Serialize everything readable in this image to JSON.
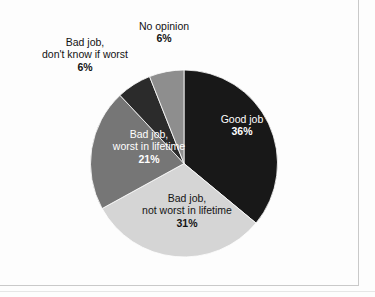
{
  "chart_data": {
    "type": "pie",
    "title": "",
    "subtitle": "",
    "xlabel": "",
    "ylabel": "",
    "legend_position": "none",
    "grid": false,
    "start_angle_deg": 0,
    "direction": "clockwise",
    "categories": [
      "Good job",
      "Bad job, not worst in lifetime",
      "Bad job, worst in lifetime",
      "Bad job, don't know if worst",
      "No opinion"
    ],
    "values": [
      36,
      31,
      21,
      6,
      6
    ],
    "value_suffix": "%",
    "slices": [
      {
        "name": "good-job",
        "label_line1": "Good job",
        "label_line2": "",
        "percent_text": "36%",
        "value": 36,
        "color": "#181818",
        "label_color": "#ffffff",
        "label_placement": "inside"
      },
      {
        "name": "bad-job-not-worst",
        "label_line1": "Bad job,",
        "label_line2": "not worst in lifetime",
        "percent_text": "31%",
        "value": 31,
        "color": "#d5d5d5",
        "label_color": "#141414",
        "label_placement": "inside"
      },
      {
        "name": "bad-job-worst",
        "label_line1": "Bad job,",
        "label_line2": "worst in lifetime",
        "percent_text": "21%",
        "value": 21,
        "color": "#767676",
        "label_color": "#ffffff",
        "label_placement": "inside"
      },
      {
        "name": "bad-job-dont-know",
        "label_line1": "Bad job,",
        "label_line2": "don't know if worst",
        "percent_text": "6%",
        "value": 6,
        "color": "#2b2b2b",
        "label_color": "#131313",
        "label_placement": "outside"
      },
      {
        "name": "no-opinion",
        "label_line1": "No opinion",
        "label_line2": "",
        "percent_text": "6%",
        "value": 6,
        "color": "#8e8e8e",
        "label_color": "#131313",
        "label_placement": "outside"
      }
    ]
  },
  "figure": {
    "background": "#fdfdfd",
    "frame_color": "#c9c9c9"
  }
}
